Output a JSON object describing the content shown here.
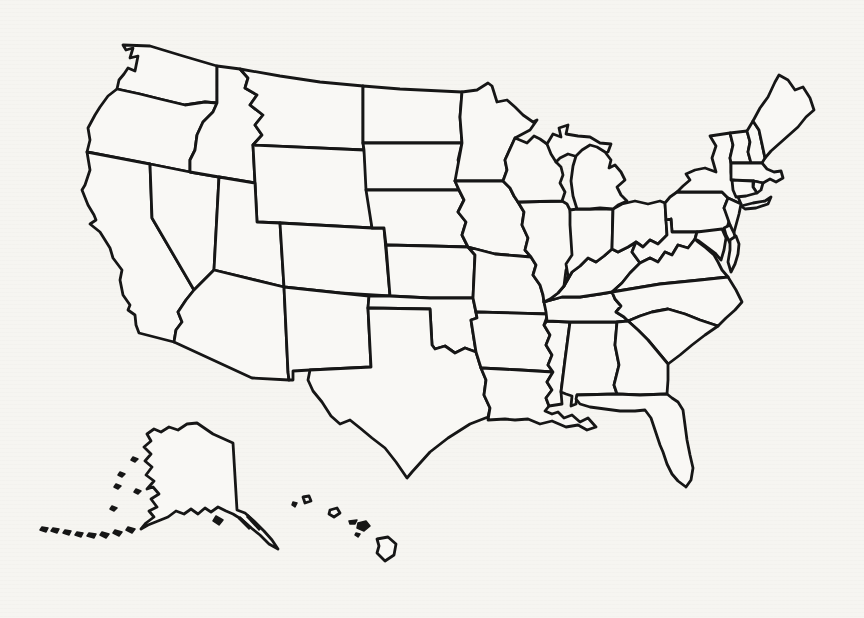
{
  "document": {
    "type": "scanned blank outline map",
    "visible_text": "",
    "background_color": "#f6f5f1"
  },
  "map": {
    "subject": "United States of America — blank state-boundary outline map (unlabeled)",
    "line_color": "#161616",
    "region_fill": "#f9f8f5",
    "stroke_width": 2.8,
    "regions": [
      "Washington",
      "Oregon",
      "California",
      "Nevada",
      "Idaho",
      "Montana",
      "Wyoming",
      "Utah",
      "Colorado",
      "Arizona",
      "New Mexico",
      "North Dakota",
      "South Dakota",
      "Nebraska",
      "Kansas",
      "Oklahoma",
      "Texas",
      "Minnesota",
      "Iowa",
      "Missouri",
      "Arkansas",
      "Louisiana",
      "Mississippi",
      "Alabama",
      "Tennessee",
      "Kentucky",
      "Illinois",
      "Indiana",
      "Ohio",
      "Wisconsin",
      "Michigan",
      "Pennsylvania",
      "West Virginia",
      "Virginia",
      "North Carolina",
      "South Carolina",
      "Georgia",
      "Florida",
      "New York",
      "Vermont",
      "New Hampshire",
      "Maine",
      "Massachusetts",
      "Rhode Island",
      "Connecticut",
      "New Jersey",
      "Delaware",
      "Maryland",
      "Alaska",
      "Hawaii"
    ],
    "insets": [
      {
        "id": "alaska",
        "label": "Alaska"
      },
      {
        "id": "hawaii",
        "label": "Hawaii"
      }
    ]
  }
}
